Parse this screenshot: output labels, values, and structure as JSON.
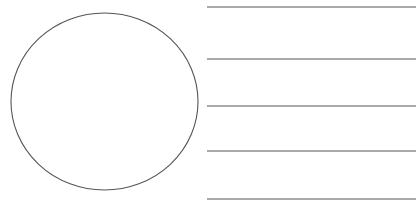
{
  "figure": {
    "background": "#ffffff",
    "stroke_color": "#555555",
    "circle": {
      "cx": 104.5,
      "cy": 101.5,
      "rx": 93.5,
      "ry": 88.5,
      "stroke_width": 1.1
    },
    "lines": [
      {
        "x1": 207,
        "x2": 416,
        "y": 7
      },
      {
        "x1": 207,
        "x2": 416,
        "y": 59
      },
      {
        "x1": 207,
        "x2": 416,
        "y": 106
      },
      {
        "x1": 207,
        "x2": 416,
        "y": 151
      },
      {
        "x1": 207,
        "x2": 416,
        "y": 199
      }
    ],
    "line_stroke_width": 1.2
  }
}
